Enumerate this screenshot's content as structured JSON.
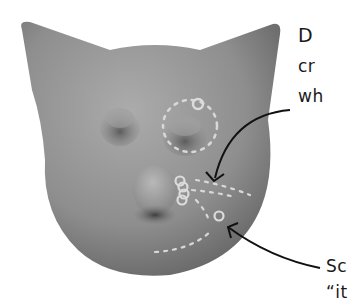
{
  "figure": {
    "colors": {
      "background": "#ffffff",
      "mesh_light": "#a8a8a8",
      "mesh_dark": "#5a5a5a",
      "annotation_dots": "#d8d8d8",
      "arrow": "#111111",
      "text": "#1a1a1a"
    }
  },
  "callouts": {
    "top": {
      "lines": [
        "D",
        "cr",
        "wh"
      ]
    },
    "bottom": {
      "lines": [
        "Sc",
        "“it"
      ]
    }
  }
}
